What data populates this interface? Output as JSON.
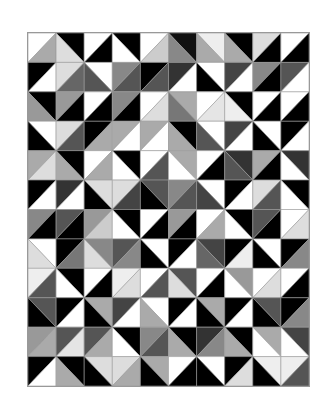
{
  "grid": {
    "cols": 10,
    "rows": 12,
    "note": "Each cell: d='/' splits into top-left (a) and bottom-right (b); d='\\' splits into top-right (a) and bottom-left (b)."
  },
  "cells": [
    [
      [
        "/",
        "#ffffff",
        "#aaaaaa"
      ],
      [
        "\\",
        "#000000",
        "#dddddd"
      ],
      [
        "/",
        "#ffffff",
        "#000000"
      ],
      [
        "\\",
        "#000000",
        "#ffffff"
      ],
      [
        "/",
        "#ffffff",
        "#cccccc"
      ],
      [
        "\\",
        "#111111",
        "#888888"
      ],
      [
        "\\",
        "#eeeeee",
        "#aaaaaa"
      ],
      [
        "\\",
        "#000000",
        "#aaaaaa"
      ],
      [
        "/",
        "#dddddd",
        "#000000"
      ],
      [
        "/",
        "#ffffff",
        "#000000"
      ]
    ],
    [
      [
        "/",
        "#000000",
        "#ffffff"
      ],
      [
        "/",
        "#dddddd",
        "#666666"
      ],
      [
        "\\",
        "#ffffff",
        "#555555"
      ],
      [
        "/",
        "#888888",
        "#555555"
      ],
      [
        "/",
        "#000000",
        "#555555"
      ],
      [
        "/",
        "#333333",
        "#ffffff"
      ],
      [
        "\\",
        "#ffffff",
        "#000000"
      ],
      [
        "/",
        "#444444",
        "#ffffff"
      ],
      [
        "/",
        "#888888",
        "#000000"
      ],
      [
        "/",
        "#555555",
        "#ffffff"
      ]
    ],
    [
      [
        "\\",
        "#000000",
        "#999999"
      ],
      [
        "/",
        "#999999",
        "#000000"
      ],
      [
        "/",
        "#ffffff",
        "#000000"
      ],
      [
        "/",
        "#888888",
        "#000000"
      ],
      [
        "/",
        "#ffffff",
        "#dddddd"
      ],
      [
        "\\",
        "#aaaaaa",
        "#777777"
      ],
      [
        "/",
        "#ffffff",
        "#e5e5e5"
      ],
      [
        "\\",
        "#000000",
        "#eeeeee"
      ],
      [
        "/",
        "#ffffff",
        "#000000"
      ],
      [
        "/",
        "#ffffff",
        "#000000"
      ]
    ],
    [
      [
        "\\",
        "#ffffff",
        "#000000"
      ],
      [
        "/",
        "#dddddd",
        "#555555"
      ],
      [
        "/",
        "#000000",
        "#aaaaaa"
      ],
      [
        "/",
        "#aaaaaa",
        "#ffffff"
      ],
      [
        "/",
        "#aaaaaa",
        "#ffffff"
      ],
      [
        "\\",
        "#000000",
        "#aaaaaa"
      ],
      [
        "\\",
        "#ffffff",
        "#555555"
      ],
      [
        "/",
        "#444444",
        "#ffffff"
      ],
      [
        "\\",
        "#ffffff",
        "#000000"
      ],
      [
        "/",
        "#000000",
        "#ffffff"
      ]
    ],
    [
      [
        "/",
        "#aaaaaa",
        "#dddddd"
      ],
      [
        "\\",
        "#000000",
        "#aaaaaa"
      ],
      [
        "/",
        "#ffffff",
        "#aaaaaa"
      ],
      [
        "\\",
        "#000000",
        "#ffffff"
      ],
      [
        "/",
        "#ffffff",
        "#555555"
      ],
      [
        "\\",
        "#aaaaaa",
        "#ffffff"
      ],
      [
        "/",
        "#ffffff",
        "#000000"
      ],
      [
        "\\",
        "#333333",
        "#555555"
      ],
      [
        "/",
        "#aaaaaa",
        "#000000"
      ],
      [
        "\\",
        "#333333",
        "#ffffff"
      ]
    ],
    [
      [
        "/",
        "#000000",
        "#ffffff"
      ],
      [
        "/",
        "#333333",
        "#ffffff"
      ],
      [
        "\\",
        "#dddddd",
        "#000000"
      ],
      [
        "/",
        "#dddddd",
        "#444444"
      ],
      [
        "\\",
        "#555555",
        "#000000"
      ],
      [
        "/",
        "#888888",
        "#555555"
      ],
      [
        "\\",
        "#ffffff",
        "#444444"
      ],
      [
        "/",
        "#000000",
        "#ffffff"
      ],
      [
        "/",
        "#dddddd",
        "#555555"
      ],
      [
        "\\",
        "#000000",
        "#ffffff"
      ]
    ],
    [
      [
        "/",
        "#888888",
        "#000000"
      ],
      [
        "/",
        "#555555",
        "#000000"
      ],
      [
        "/",
        "#999999",
        "#cccccc"
      ],
      [
        "\\",
        "#000000",
        "#ffffff"
      ],
      [
        "/",
        "#ffffff",
        "#000000"
      ],
      [
        "/",
        "#999999",
        "#000000"
      ],
      [
        "/",
        "#ffffff",
        "#aaaaaa"
      ],
      [
        "\\",
        "#000000",
        "#ffffff"
      ],
      [
        "/",
        "#555555",
        "#000000"
      ],
      [
        "/",
        "#ffffff",
        "#dddddd"
      ]
    ],
    [
      [
        "\\",
        "#ffffff",
        "#dddddd"
      ],
      [
        "/",
        "#000000",
        "#777777"
      ],
      [
        "\\",
        "#888888",
        "#dddddd"
      ],
      [
        "/",
        "#555555",
        "#888888"
      ],
      [
        "\\",
        "#ffffff",
        "#000000"
      ],
      [
        "/",
        "#000000",
        "#ffffff"
      ],
      [
        "\\",
        "#444444",
        "#666666"
      ],
      [
        "/",
        "#000000",
        "#eeeeee"
      ],
      [
        "\\",
        "#ffffff",
        "#000000"
      ],
      [
        "/",
        "#000000",
        "#888888"
      ]
    ],
    [
      [
        "/",
        "#eeeeee",
        "#555555"
      ],
      [
        "\\",
        "#000000",
        "#ffffff"
      ],
      [
        "/",
        "#ffffff",
        "#000000"
      ],
      [
        "/",
        "#eeeeee",
        "#dddddd"
      ],
      [
        "/",
        "#ffffff",
        "#555555"
      ],
      [
        "\\",
        "#555555",
        "#dddddd"
      ],
      [
        "/",
        "#ffffff",
        "#000000"
      ],
      [
        "\\",
        "#999999",
        "#ffffff"
      ],
      [
        "/",
        "#ffffff",
        "#dddddd"
      ],
      [
        "/",
        "#ffffff",
        "#000000"
      ]
    ],
    [
      [
        "\\",
        "#555555",
        "#000000"
      ],
      [
        "/",
        "#000000",
        "#ffffff"
      ],
      [
        "\\",
        "#aaaaaa",
        "#000000"
      ],
      [
        "/",
        "#444444",
        "#ffffff"
      ],
      [
        "\\",
        "#ffffff",
        "#aaaaaa"
      ],
      [
        "/",
        "#000000",
        "#ffffff"
      ],
      [
        "\\",
        "#aaaaaa",
        "#000000"
      ],
      [
        "/",
        "#000000",
        "#ffffff"
      ],
      [
        "\\",
        "#555555",
        "#000000"
      ],
      [
        "/",
        "#000000",
        "#888888"
      ]
    ],
    [
      [
        "/",
        "#999999",
        "#aaaaaa"
      ],
      [
        "/",
        "#555555",
        "#e5e5e5"
      ],
      [
        "/",
        "#555555",
        "#aaaaaa"
      ],
      [
        "\\",
        "#000000",
        "#ffffff"
      ],
      [
        "/",
        "#888888",
        "#555555"
      ],
      [
        "\\",
        "#000000",
        "#aaaaaa"
      ],
      [
        "/",
        "#333333",
        "#888888"
      ],
      [
        "\\",
        "#000000",
        "#aaaaaa"
      ],
      [
        "\\",
        "#aaaaaa",
        "#ffffff"
      ],
      [
        "\\",
        "#444444",
        "#ffffff"
      ]
    ],
    [
      [
        "/",
        "#000000",
        "#ffffff"
      ],
      [
        "\\",
        "#000000",
        "#aaaaaa"
      ],
      [
        "\\",
        "#dddddd",
        "#000000"
      ],
      [
        "/",
        "#dddddd",
        "#aaaaaa"
      ],
      [
        "\\",
        "#aaaaaa",
        "#000000"
      ],
      [
        "/",
        "#ffffff",
        "#000000"
      ],
      [
        "\\",
        "#ffffff",
        "#000000"
      ],
      [
        "/",
        "#000000",
        "#dddddd"
      ],
      [
        "\\",
        "#eeeeee",
        "#000000"
      ],
      [
        "/",
        "#eeeeee",
        "#555555"
      ]
    ]
  ]
}
